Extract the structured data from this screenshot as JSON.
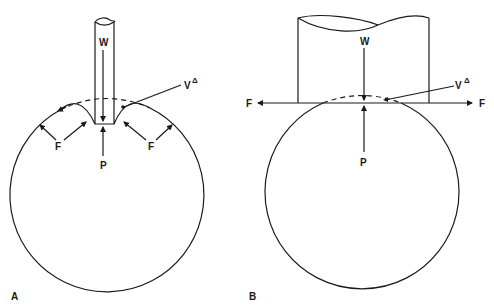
{
  "figure": {
    "panels": [
      {
        "id": "A",
        "label": "A",
        "labels": {
          "load": "W",
          "reaction": "P",
          "force_left": "F",
          "force_right": "F",
          "volume": "V",
          "volume_symbol": "Δ"
        }
      },
      {
        "id": "B",
        "label": "B",
        "labels": {
          "load": "W",
          "reaction": "P",
          "force_left": "F",
          "force_right": "F",
          "volume": "V",
          "volume_symbol": "Δ"
        }
      }
    ],
    "colors": {
      "ink": "#1a1a1a",
      "background": "#ffffff"
    }
  }
}
